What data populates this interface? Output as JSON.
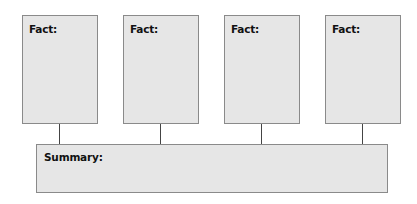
{
  "diagram": {
    "facts": [
      {
        "label": "Fact:",
        "content": ""
      },
      {
        "label": "Fact:",
        "content": ""
      },
      {
        "label": "Fact:",
        "content": ""
      },
      {
        "label": "Fact:",
        "content": ""
      }
    ],
    "summary": {
      "label": "Summary:",
      "content": ""
    },
    "colors": {
      "box_fill": "#e6e6e6",
      "box_border": "#8a8a8a",
      "connector": "#444444"
    }
  }
}
